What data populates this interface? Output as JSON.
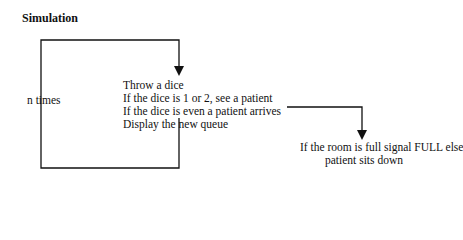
{
  "title": "Simulation",
  "loop_label": "n times",
  "steps": [
    "Throw a dice",
    "If the dice is 1 or 2, see a patient",
    "If the dice is even a patient arrives",
    "Display the new queue"
  ],
  "outcome": {
    "line1": "If the room is full signal FULL else",
    "line2": "patient sits down"
  },
  "colors": {
    "line": "#111111",
    "background": "#ffffff"
  }
}
